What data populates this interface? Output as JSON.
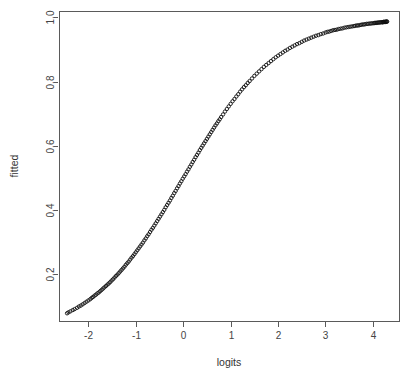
{
  "chart_data": {
    "type": "scatter",
    "title": "",
    "xlabel": "logits",
    "ylabel": "fitted",
    "xlim": [
      -2.62,
      4.55
    ],
    "ylim": [
      0.055,
      1.02
    ],
    "xticks": [
      -2,
      -1,
      0,
      1,
      2,
      3,
      4
    ],
    "xticklabels": [
      "-2",
      "-1",
      "0",
      "1",
      "2",
      "3",
      "4"
    ],
    "yticks": [
      0.2,
      0.4,
      0.6,
      0.8,
      1.0
    ],
    "yticklabels": [
      "0.2",
      "0.4",
      "0.6",
      "0.8",
      "1.0"
    ],
    "grid": false,
    "legend": null,
    "marker": "open-circle",
    "marker_size": 3,
    "point_color": "#111111",
    "relation": "fitted = 1 / (1 + exp(-logits))",
    "n_points": 200,
    "x": [
      -2.45,
      -2.42,
      -2.38,
      -2.33,
      -2.29,
      -2.24,
      -2.2,
      -2.16,
      -2.12,
      -2.08,
      -2.04,
      -2.0,
      -1.96,
      -1.93,
      -1.9,
      -1.87,
      -1.84,
      -1.81,
      -1.78,
      -1.75,
      -1.72,
      -1.69,
      -1.66,
      -1.63,
      -1.6,
      -1.57,
      -1.54,
      -1.51,
      -1.48,
      -1.45,
      -1.42,
      -1.39,
      -1.36,
      -1.33,
      -1.3,
      -1.27,
      -1.24,
      -1.21,
      -1.18,
      -1.15,
      -1.12,
      -1.09,
      -1.06,
      -1.03,
      -1.0,
      -0.97,
      -0.94,
      -0.91,
      -0.88,
      -0.85,
      -0.82,
      -0.79,
      -0.76,
      -0.73,
      -0.7,
      -0.67,
      -0.64,
      -0.61,
      -0.58,
      -0.55,
      -0.52,
      -0.49,
      -0.46,
      -0.43,
      -0.4,
      -0.37,
      -0.34,
      -0.31,
      -0.28,
      -0.25,
      -0.22,
      -0.19,
      -0.16,
      -0.13,
      -0.1,
      -0.07,
      -0.04,
      -0.01,
      0.02,
      0.05,
      0.08,
      0.11,
      0.14,
      0.17,
      0.2,
      0.23,
      0.26,
      0.29,
      0.32,
      0.35,
      0.38,
      0.41,
      0.44,
      0.47,
      0.5,
      0.53,
      0.56,
      0.59,
      0.62,
      0.65,
      0.68,
      0.71,
      0.74,
      0.77,
      0.8,
      0.84,
      0.88,
      0.92,
      0.96,
      1.0,
      1.04,
      1.08,
      1.12,
      1.16,
      1.2,
      1.24,
      1.28,
      1.32,
      1.36,
      1.4,
      1.45,
      1.5,
      1.55,
      1.6,
      1.65,
      1.7,
      1.75,
      1.8,
      1.85,
      1.9,
      1.95,
      2.0,
      2.05,
      2.1,
      2.15,
      2.2,
      2.25,
      2.3,
      2.35,
      2.4,
      2.45,
      2.5,
      2.55,
      2.6,
      2.65,
      2.7,
      2.75,
      2.8,
      2.85,
      2.9,
      2.95,
      3.0,
      3.04,
      3.08,
      3.12,
      3.16,
      3.2,
      3.24,
      3.28,
      3.32,
      3.36,
      3.4,
      3.44,
      3.48,
      3.52,
      3.56,
      3.6,
      3.63,
      3.66,
      3.69,
      3.72,
      3.75,
      3.78,
      3.81,
      3.84,
      3.87,
      3.9,
      3.93,
      3.96,
      3.99,
      4.02,
      4.04,
      4.06,
      4.08,
      4.1,
      4.12,
      4.14,
      4.16,
      4.18,
      4.2,
      4.21,
      4.22,
      4.23,
      4.24,
      4.25,
      4.26,
      4.27,
      4.28,
      4.29,
      4.3
    ],
    "y": [
      0.079,
      0.082,
      0.085,
      0.089,
      0.092,
      0.096,
      0.1,
      0.103,
      0.107,
      0.111,
      0.115,
      0.119,
      0.123,
      0.127,
      0.13,
      0.134,
      0.137,
      0.141,
      0.144,
      0.148,
      0.152,
      0.156,
      0.16,
      0.164,
      0.168,
      0.172,
      0.176,
      0.181,
      0.185,
      0.19,
      0.195,
      0.199,
      0.204,
      0.209,
      0.214,
      0.219,
      0.224,
      0.23,
      0.235,
      0.24,
      0.246,
      0.252,
      0.257,
      0.263,
      0.269,
      0.275,
      0.281,
      0.287,
      0.293,
      0.299,
      0.306,
      0.312,
      0.319,
      0.325,
      0.332,
      0.339,
      0.345,
      0.352,
      0.359,
      0.366,
      0.373,
      0.38,
      0.387,
      0.394,
      0.401,
      0.409,
      0.416,
      0.423,
      0.43,
      0.438,
      0.445,
      0.453,
      0.46,
      0.468,
      0.475,
      0.483,
      0.49,
      0.498,
      0.505,
      0.512,
      0.52,
      0.527,
      0.535,
      0.542,
      0.55,
      0.557,
      0.565,
      0.572,
      0.579,
      0.587,
      0.594,
      0.601,
      0.608,
      0.615,
      0.622,
      0.629,
      0.636,
      0.643,
      0.65,
      0.657,
      0.664,
      0.67,
      0.677,
      0.683,
      0.69,
      0.698,
      0.707,
      0.715,
      0.723,
      0.731,
      0.739,
      0.746,
      0.754,
      0.761,
      0.769,
      0.776,
      0.783,
      0.789,
      0.796,
      0.802,
      0.81,
      0.818,
      0.825,
      0.832,
      0.839,
      0.846,
      0.852,
      0.858,
      0.864,
      0.87,
      0.876,
      0.881,
      0.886,
      0.891,
      0.896,
      0.9,
      0.905,
      0.909,
      0.913,
      0.917,
      0.92,
      0.924,
      0.928,
      0.931,
      0.934,
      0.937,
      0.94,
      0.943,
      0.945,
      0.948,
      0.95,
      0.953,
      0.955,
      0.956,
      0.958,
      0.96,
      0.961,
      0.962,
      0.964,
      0.965,
      0.966,
      0.968,
      0.969,
      0.97,
      0.971,
      0.972,
      0.973,
      0.974,
      0.975,
      0.975,
      0.976,
      0.977,
      0.978,
      0.978,
      0.979,
      0.98,
      0.98,
      0.981,
      0.981,
      0.982,
      0.982,
      0.983,
      0.983,
      0.983,
      0.984,
      0.984,
      0.984,
      0.985,
      0.985,
      0.985,
      0.985,
      0.986,
      0.986,
      0.986,
      0.986,
      0.986,
      0.986,
      0.987,
      0.987,
      0.987
    ]
  },
  "plot_geometry": {
    "box_left": 59,
    "box_right": 399,
    "box_top": 11,
    "box_bottom": 321,
    "axis_color": "#5a5a5a",
    "background": "#ffffff"
  }
}
